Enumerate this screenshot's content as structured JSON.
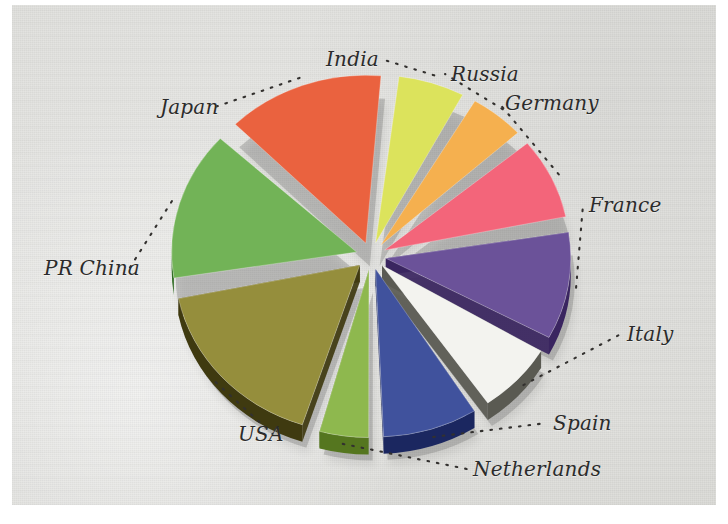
{
  "figure": {
    "background_color": "#e3e3e0",
    "page_color": "#ffffff",
    "label_color": "#2b2b2b",
    "leader_style": "dotted"
  },
  "chart_data": {
    "type": "pie",
    "title": "",
    "subtitle": "",
    "xlabel": "",
    "ylabel": "",
    "exploded": true,
    "three_d": true,
    "legend_position": "none",
    "label_placement": "outside-with-dotted-leaders",
    "start_angle_deg": -84,
    "direction": "clockwise",
    "categories": [
      "India",
      "Russia",
      "Germany",
      "France",
      "Italy",
      "Spain",
      "Netherlands",
      "USA",
      "PR China",
      "Japan"
    ],
    "values": [
      6.5,
      5.5,
      8.5,
      11.0,
      7.5,
      9.0,
      5.0,
      17.5,
      15.0,
      14.5
    ],
    "unit": "percent",
    "slices": [
      {
        "label": "India",
        "value": 6.5,
        "color": "#d9e04a",
        "side_color": "#9aa02c",
        "label_x": 326,
        "label_y": 47,
        "anchor": "start"
      },
      {
        "label": "Russia",
        "value": 5.5,
        "color": "#f4a73c",
        "side_color": "#b97d1e",
        "label_x": 451,
        "label_y": 62,
        "anchor": "start"
      },
      {
        "label": "Germany",
        "value": 8.5,
        "color": "#f2546b",
        "side_color": "#9c1230",
        "label_x": 505,
        "label_y": 91,
        "anchor": "start"
      },
      {
        "label": "France",
        "value": 11.0,
        "color": "#5b3f8e",
        "side_color": "#3a2560",
        "label_x": 589,
        "label_y": 193,
        "anchor": "start"
      },
      {
        "label": "Italy",
        "value": 7.5,
        "color": "#f2f2ee",
        "side_color": "#5a5a52",
        "label_x": 627,
        "label_y": 322,
        "anchor": "start"
      },
      {
        "label": "Spain",
        "value": 9.0,
        "color": "#2b3f92",
        "side_color": "#1b2760",
        "label_x": 553,
        "label_y": 411,
        "anchor": "start"
      },
      {
        "label": "Netherlands",
        "value": 5.0,
        "color": "#82b03a",
        "side_color": "#55761f",
        "label_x": 473,
        "label_y": 457,
        "anchor": "start"
      },
      {
        "label": "USA",
        "value": 17.5,
        "color": "#8a8226",
        "side_color": "#3f3a10",
        "label_x": 238,
        "label_y": 422,
        "anchor": "start"
      },
      {
        "label": "PR China",
        "value": 15.0,
        "color": "#63ab44",
        "side_color": "#2f6b23",
        "label_x": 44,
        "label_y": 256,
        "anchor": "start"
      },
      {
        "label": "Japan",
        "value": 14.5,
        "color": "#e8512a",
        "side_color": "#8e1414",
        "label_x": 160,
        "label_y": 95,
        "anchor": "start"
      }
    ]
  }
}
